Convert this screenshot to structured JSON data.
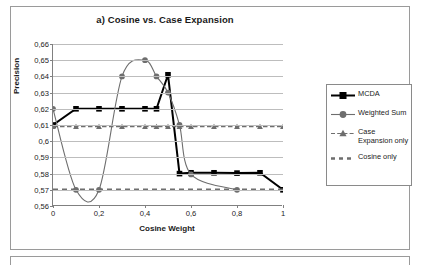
{
  "chart_data": {
    "type": "line",
    "title": "a) Cosine vs. Case Expansion",
    "xlabel": "Cosine Weight",
    "ylabel": "Precision",
    "xlim": [
      0,
      1
    ],
    "ylim": [
      0.56,
      0.66
    ],
    "grid": true,
    "legend_position": "right",
    "xticks": [
      "0",
      "0,2",
      "0,4",
      "0,6",
      "0,8",
      "1"
    ],
    "xtick_values": [
      0,
      0.2,
      0.4,
      0.6,
      0.8,
      1
    ],
    "yticks": [
      "0,56",
      "0,57",
      "0,58",
      "0,59",
      "0,6",
      "0,61",
      "0,62",
      "0,63",
      "0,64",
      "0,65",
      "0,66"
    ],
    "ytick_values": [
      0.56,
      0.57,
      0.58,
      0.59,
      0.6,
      0.61,
      0.62,
      0.63,
      0.64,
      0.65,
      0.66
    ],
    "series": [
      {
        "name": "MCDA",
        "marker": "square",
        "color": "#000000",
        "style": "solid",
        "x": [
          0,
          0.1,
          0.2,
          0.3,
          0.4,
          0.45,
          0.5,
          0.55,
          0.6,
          0.7,
          0.8,
          0.9,
          1
        ],
        "values": [
          0.61,
          0.62,
          0.62,
          0.62,
          0.62,
          0.62,
          0.641,
          0.58,
          0.5805,
          0.5805,
          0.5803,
          0.5805,
          0.57
        ]
      },
      {
        "name": "Weighted Sum",
        "marker": "circle",
        "color": "#6e6e6e",
        "style": "solid",
        "x": [
          0,
          0.1,
          0.2,
          0.3,
          0.4,
          0.45,
          0.5,
          0.55,
          0.6,
          0.8
        ],
        "values": [
          0.62,
          0.57,
          0.57,
          0.64,
          0.65,
          0.64,
          0.63,
          0.61,
          0.5795,
          0.57
        ]
      },
      {
        "name": "Case Expansion only",
        "marker": "triangle",
        "color": "#6e6e6e",
        "style": "dashed",
        "x": [
          0,
          0.1,
          0.2,
          0.3,
          0.4,
          0.45,
          0.5,
          0.55,
          0.6,
          0.7,
          0.8,
          0.9,
          1
        ],
        "values": [
          0.609,
          0.609,
          0.609,
          0.609,
          0.609,
          0.609,
          0.609,
          0.609,
          0.609,
          0.609,
          0.609,
          0.609,
          0.609
        ]
      },
      {
        "name": "Cosine only",
        "marker": "none",
        "color": "#6e6e6e",
        "style": "thick-dashed",
        "x": [
          0,
          1
        ],
        "values": [
          0.57,
          0.57
        ]
      }
    ]
  },
  "legend": {
    "entries": [
      {
        "label": "MCDA"
      },
      {
        "label": "Weighted Sum"
      },
      {
        "label": "Case Expansion only"
      },
      {
        "label": "Cosine only"
      }
    ]
  }
}
